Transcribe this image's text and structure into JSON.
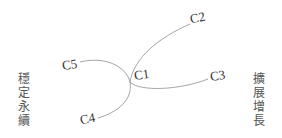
{
  "diagram": {
    "nodes": [
      {
        "id": "C1",
        "label": "C1"
      },
      {
        "id": "C2",
        "label": "C2"
      },
      {
        "id": "C3",
        "label": "C3"
      },
      {
        "id": "C4",
        "label": "C4"
      },
      {
        "id": "C5",
        "label": "C5"
      }
    ],
    "edges": [
      {
        "from": "C1",
        "to": "C2"
      },
      {
        "from": "C1",
        "to": "C3"
      },
      {
        "from": "C1",
        "to": "C4"
      },
      {
        "from": "C1",
        "to": "C5"
      }
    ],
    "left_label": "穩定永續",
    "right_label": "擴展增長",
    "line_color": "#9a9a9a",
    "text_color": "#333333"
  }
}
